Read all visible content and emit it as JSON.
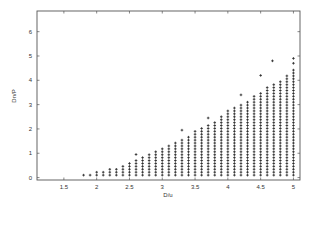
{
  "chart_data": {
    "type": "scatter",
    "title": "",
    "xlabel": "D/u",
    "ylabel": "Dn/P",
    "xlim": [
      1.09,
      5.1
    ],
    "ylim": [
      -0.1,
      6.85
    ],
    "xticks": [
      1.5,
      2,
      2.5,
      3,
      3.5,
      4,
      4.5,
      5
    ],
    "xtick_labels": [
      "1.5",
      "2",
      "2.5",
      "3",
      "3.5",
      "4",
      "4.5",
      "5"
    ],
    "yticks": [
      0,
      1,
      2,
      3,
      4,
      5,
      6
    ],
    "ytick_labels": [
      "0",
      "1",
      "2",
      "3",
      "4",
      "5",
      "6"
    ],
    "grid": false,
    "legend": null,
    "marker": "+",
    "series": [
      {
        "name": "feasible region",
        "description": "Grid of points filling region under upper boundary; columns every 0.1 in x from 1.8 to 5.0, rows every ~0.12 in y from 0.1 up to column top",
        "column_x": [
          1.8,
          1.9,
          2.0,
          2.1,
          2.2,
          2.3,
          2.4,
          2.5,
          2.6,
          2.7,
          2.8,
          2.9,
          3.0,
          3.1,
          3.2,
          3.3,
          3.4,
          3.5,
          3.6,
          3.7,
          3.8,
          3.9,
          4.0,
          4.1,
          4.2,
          4.3,
          4.4,
          4.5,
          4.6,
          4.7,
          4.8,
          4.9,
          5.0
        ],
        "column_top_y": [
          0.1,
          0.15,
          0.25,
          0.3,
          0.4,
          0.45,
          0.55,
          0.65,
          0.75,
          0.85,
          1.0,
          1.1,
          1.25,
          1.35,
          1.45,
          1.55,
          1.75,
          1.95,
          2.05,
          2.15,
          2.3,
          2.55,
          2.75,
          2.9,
          3.05,
          3.2,
          3.35,
          3.55,
          3.7,
          3.85,
          4.05,
          4.25,
          4.45
        ],
        "row_step": 0.12,
        "row_start": 0.1
      },
      {
        "name": "outliers",
        "x": [
          2.6,
          3.3,
          3.7,
          4.2,
          4.5,
          4.68,
          5.0,
          5.0
        ],
        "y": [
          0.95,
          1.95,
          2.45,
          3.4,
          4.2,
          4.8,
          4.7,
          4.9
        ]
      }
    ]
  }
}
